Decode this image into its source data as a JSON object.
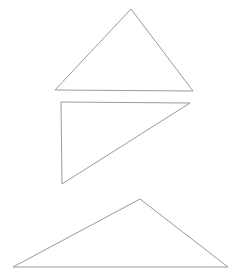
{
  "canvas": {
    "width": 241,
    "height": 280,
    "background_color": "#ffffff"
  },
  "figure": {
    "title": "",
    "shape_count": 3
  },
  "chart_data": {
    "type": "scatter",
    "title": "",
    "xlabel": "",
    "ylabel": "",
    "grid": false,
    "legend": "none",
    "xlim": [
      0,
      241
    ],
    "ylim": [
      280,
      0
    ],
    "shapes": [
      {
        "name": "triangle-isosceles-top",
        "kind": "triangle",
        "points": [
          [
            131,
            9
          ],
          [
            193,
            91
          ],
          [
            55,
            90
          ]
        ],
        "points_attr": "131,9 193,91 55,90",
        "stroke": "#9a9a9a",
        "stroke_width": 1,
        "fill": "none"
      },
      {
        "name": "triangle-right-middle",
        "kind": "triangle",
        "points": [
          [
            61,
            102
          ],
          [
            190,
            103
          ],
          [
            62,
            184
          ]
        ],
        "points_attr": "61,102 190,103 62,184",
        "stroke": "#9a9a9a",
        "stroke_width": 1,
        "fill": "none"
      },
      {
        "name": "triangle-obtuse-bottom",
        "kind": "triangle",
        "points": [
          [
            140,
            199
          ],
          [
            228,
            267
          ],
          [
            13,
            267
          ]
        ],
        "points_attr": "140,199 228,267 13,267",
        "stroke": "#9a9a9a",
        "stroke_width": 1,
        "fill": "none"
      }
    ]
  }
}
